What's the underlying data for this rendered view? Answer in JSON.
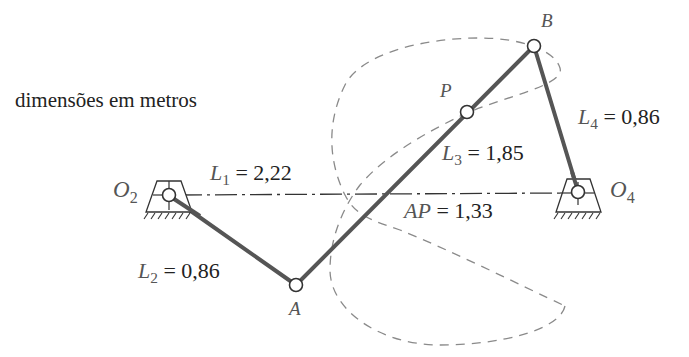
{
  "caption": "dimensões em metros",
  "colors": {
    "link": "#555555",
    "dashed_curve": "#8a8a8a",
    "ground_line": "#333333",
    "text": "#222222",
    "italic_text": "#555555"
  },
  "points": {
    "O2": {
      "name": "O",
      "sub": "2"
    },
    "O4": {
      "name": "O",
      "sub": "4"
    },
    "A": {
      "name": "A"
    },
    "B": {
      "name": "B"
    },
    "P": {
      "name": "P"
    }
  },
  "dimensions": {
    "L1": {
      "sym": "L",
      "sub": "1",
      "eq": " = 2,22"
    },
    "L2": {
      "sym": "L",
      "sub": "2",
      "eq": " = 0,86"
    },
    "L3": {
      "sym": "L",
      "sub": "3",
      "eq": " = 1,85"
    },
    "L4": {
      "sym": "L",
      "sub": "4",
      "eq": " = 0,86"
    },
    "AP": {
      "sym": "AP",
      "eq": " = 1,33"
    }
  }
}
